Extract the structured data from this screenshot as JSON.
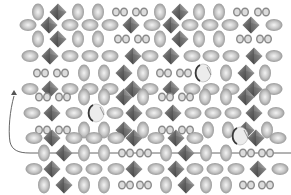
{
  "figure": {
    "width": 291,
    "height": 195,
    "background": "#ffffff"
  },
  "colors": {
    "ellipsoid_edge": "#9a9a9a",
    "ellipsoid_center": "#f2f2f2",
    "ellipsoid_mid": "#c4c4c4",
    "octahedron_dark": "#4a4a4a",
    "octahedron_mid": "#7a7a7a",
    "octahedron_light": "#a8a8a8",
    "ring": "#8a8a8a",
    "path": "#555555"
  },
  "period_x": 140,
  "rows": [
    {
      "y": 12,
      "items": [
        {
          "t": "v",
          "x": 38
        },
        {
          "t": "o",
          "x": 58
        },
        {
          "t": "v",
          "x": 78
        },
        {
          "t": "v",
          "x": 98
        },
        {
          "t": "r",
          "x": 116
        },
        {
          "t": "r",
          "x": 124
        },
        {
          "t": "r",
          "x": 136
        },
        {
          "t": "r",
          "x": 144
        },
        {
          "t": "v",
          "x": 160
        },
        {
          "t": "o",
          "x": 180
        },
        {
          "t": "v",
          "x": 199
        },
        {
          "t": "v",
          "x": 219
        },
        {
          "t": "r",
          "x": 237
        },
        {
          "t": "r",
          "x": 245
        },
        {
          "t": "r",
          "x": 258
        },
        {
          "t": "r",
          "x": 266
        }
      ]
    },
    {
      "y": 25,
      "items": [
        {
          "t": "h",
          "x": 28
        },
        {
          "t": "o",
          "x": 49
        },
        {
          "t": "h",
          "x": 70
        },
        {
          "t": "h",
          "x": 90
        },
        {
          "t": "h",
          "x": 110
        },
        {
          "t": "o",
          "x": 131
        },
        {
          "t": "h",
          "x": 152
        },
        {
          "t": "o",
          "x": 171
        },
        {
          "t": "h",
          "x": 190
        },
        {
          "t": "h",
          "x": 210
        },
        {
          "t": "h",
          "x": 230
        },
        {
          "t": "o",
          "x": 251
        },
        {
          "t": "h",
          "x": 274
        }
      ]
    },
    {
      "y": 39,
      "items": [
        {
          "t": "v",
          "x": 38
        },
        {
          "t": "o",
          "x": 58
        },
        {
          "t": "v",
          "x": 78
        },
        {
          "t": "v",
          "x": 98
        },
        {
          "t": "r",
          "x": 118
        },
        {
          "t": "r",
          "x": 126
        },
        {
          "t": "r",
          "x": 138
        },
        {
          "t": "r",
          "x": 146
        },
        {
          "t": "v",
          "x": 160
        },
        {
          "t": "o",
          "x": 180
        },
        {
          "t": "v",
          "x": 199
        },
        {
          "t": "v",
          "x": 219
        },
        {
          "t": "r",
          "x": 240
        },
        {
          "t": "r",
          "x": 248
        },
        {
          "t": "r",
          "x": 260
        },
        {
          "t": "r",
          "x": 268
        }
      ]
    },
    {
      "y": 56,
      "items": [
        {
          "t": "h",
          "x": 30
        },
        {
          "t": "o",
          "x": 50
        },
        {
          "t": "h",
          "x": 70
        },
        {
          "t": "h",
          "x": 90
        },
        {
          "t": "h",
          "x": 110
        },
        {
          "t": "o",
          "x": 133
        },
        {
          "t": "h",
          "x": 150
        },
        {
          "t": "o",
          "x": 171
        },
        {
          "t": "h",
          "x": 192
        },
        {
          "t": "h",
          "x": 211
        },
        {
          "t": "h",
          "x": 231
        },
        {
          "t": "o",
          "x": 254
        },
        {
          "t": "h",
          "x": 274
        }
      ]
    },
    {
      "y": 73,
      "items": [
        {
          "t": "r",
          "x": 37
        },
        {
          "t": "r",
          "x": 45
        },
        {
          "t": "r",
          "x": 57
        },
        {
          "t": "r",
          "x": 65
        },
        {
          "t": "v",
          "x": 84
        },
        {
          "t": "v",
          "x": 104
        },
        {
          "t": "o",
          "x": 124
        },
        {
          "t": "v",
          "x": 143
        },
        {
          "t": "r",
          "x": 160
        },
        {
          "t": "r",
          "x": 168
        },
        {
          "t": "r",
          "x": 180
        },
        {
          "t": "r",
          "x": 188
        },
        {
          "t": "v",
          "x": 205
        },
        {
          "t": "v",
          "x": 226
        },
        {
          "t": "o",
          "x": 246
        },
        {
          "t": "v",
          "x": 265
        }
      ]
    },
    {
      "y": 80,
      "items": [
        {
          "t": "c",
          "x": 203,
          "y": 73
        }
      ]
    },
    {
      "y": 89,
      "items": [
        {
          "t": "h",
          "x": 30
        },
        {
          "t": "o",
          "x": 50
        },
        {
          "t": "h",
          "x": 70
        },
        {
          "t": "h",
          "x": 90
        },
        {
          "t": "h",
          "x": 110
        },
        {
          "t": "o",
          "x": 133
        },
        {
          "t": "h",
          "x": 150
        },
        {
          "t": "o",
          "x": 171
        },
        {
          "t": "h",
          "x": 192
        },
        {
          "t": "h",
          "x": 211
        },
        {
          "t": "h",
          "x": 231
        },
        {
          "t": "o",
          "x": 254
        },
        {
          "t": "h",
          "x": 274
        }
      ]
    },
    {
      "y": 97,
      "items": [
        {
          "t": "r",
          "x": 39
        },
        {
          "t": "r",
          "x": 47
        },
        {
          "t": "r",
          "x": 59
        },
        {
          "t": "r",
          "x": 67
        },
        {
          "t": "v",
          "x": 84
        },
        {
          "t": "v",
          "x": 104
        },
        {
          "t": "o",
          "x": 124
        },
        {
          "t": "v",
          "x": 143
        },
        {
          "t": "r",
          "x": 162
        },
        {
          "t": "r",
          "x": 170
        },
        {
          "t": "r",
          "x": 182
        },
        {
          "t": "r",
          "x": 190
        },
        {
          "t": "v",
          "x": 205
        },
        {
          "t": "v",
          "x": 226
        },
        {
          "t": "o",
          "x": 246
        },
        {
          "t": "v",
          "x": 265
        }
      ]
    },
    {
      "y": 113,
      "items": [
        {
          "t": "h",
          "x": 32
        },
        {
          "t": "o",
          "x": 52
        },
        {
          "t": "h",
          "x": 74
        },
        {
          "t": "c",
          "x": 96
        },
        {
          "t": "h",
          "x": 115
        },
        {
          "t": "o",
          "x": 134
        },
        {
          "t": "h",
          "x": 154
        },
        {
          "t": "o",
          "x": 173
        },
        {
          "t": "h",
          "x": 193
        },
        {
          "t": "h",
          "x": 213
        },
        {
          "t": "h",
          "x": 233
        },
        {
          "t": "o",
          "x": 254
        },
        {
          "t": "h",
          "x": 276
        }
      ]
    },
    {
      "y": 130,
      "items": [
        {
          "t": "r",
          "x": 39
        },
        {
          "t": "r",
          "x": 47
        },
        {
          "t": "r",
          "x": 59
        },
        {
          "t": "r",
          "x": 67
        },
        {
          "t": "v",
          "x": 84
        },
        {
          "t": "v",
          "x": 104
        },
        {
          "t": "o",
          "x": 124
        },
        {
          "t": "v",
          "x": 143
        },
        {
          "t": "r",
          "x": 162
        },
        {
          "t": "r",
          "x": 170
        },
        {
          "t": "r",
          "x": 182
        },
        {
          "t": "r",
          "x": 190
        },
        {
          "t": "v",
          "x": 208
        },
        {
          "t": "v",
          "x": 228
        },
        {
          "t": "o",
          "x": 246
        },
        {
          "t": "v",
          "x": 267
        }
      ]
    },
    {
      "y": 138,
      "items": [
        {
          "t": "h",
          "x": 34
        },
        {
          "t": "o",
          "x": 52
        },
        {
          "t": "h",
          "x": 74
        },
        {
          "t": "h",
          "x": 94
        },
        {
          "t": "h",
          "x": 116
        },
        {
          "t": "o",
          "x": 134
        },
        {
          "t": "h",
          "x": 156
        },
        {
          "t": "o",
          "x": 176
        },
        {
          "t": "h",
          "x": 195
        },
        {
          "t": "c",
          "x": 240,
          "y": 136
        },
        {
          "t": "o",
          "x": 256
        },
        {
          "t": "h",
          "x": 278
        }
      ]
    },
    {
      "y": 153,
      "items": [
        {
          "t": "v",
          "x": 44
        },
        {
          "t": "o",
          "x": 64
        },
        {
          "t": "v",
          "x": 84
        },
        {
          "t": "v",
          "x": 104
        },
        {
          "t": "r",
          "x": 122
        },
        {
          "t": "r",
          "x": 130
        },
        {
          "t": "r",
          "x": 140
        },
        {
          "t": "r",
          "x": 148
        },
        {
          "t": "v",
          "x": 166
        },
        {
          "t": "o",
          "x": 186
        },
        {
          "t": "v",
          "x": 206
        },
        {
          "t": "v",
          "x": 226
        },
        {
          "t": "r",
          "x": 243
        },
        {
          "t": "r",
          "x": 251
        },
        {
          "t": "r",
          "x": 262
        },
        {
          "t": "r",
          "x": 270
        }
      ]
    },
    {
      "y": 169,
      "items": [
        {
          "t": "h",
          "x": 34
        },
        {
          "t": "o",
          "x": 52
        },
        {
          "t": "h",
          "x": 74
        },
        {
          "t": "h",
          "x": 94
        },
        {
          "t": "h",
          "x": 116
        },
        {
          "t": "o",
          "x": 134
        },
        {
          "t": "h",
          "x": 156
        },
        {
          "t": "o",
          "x": 176
        },
        {
          "t": "h",
          "x": 195
        },
        {
          "t": "h",
          "x": 215
        },
        {
          "t": "h",
          "x": 236
        },
        {
          "t": "o",
          "x": 258
        },
        {
          "t": "h",
          "x": 280
        }
      ]
    },
    {
      "y": 185,
      "items": [
        {
          "t": "v",
          "x": 44
        },
        {
          "t": "o",
          "x": 64
        },
        {
          "t": "v",
          "x": 84
        },
        {
          "t": "v",
          "x": 104
        },
        {
          "t": "r",
          "x": 122
        },
        {
          "t": "r",
          "x": 130
        },
        {
          "t": "r",
          "x": 140
        },
        {
          "t": "r",
          "x": 148
        },
        {
          "t": "v",
          "x": 166
        },
        {
          "t": "o",
          "x": 186
        },
        {
          "t": "v",
          "x": 206
        },
        {
          "t": "v",
          "x": 226
        },
        {
          "t": "r",
          "x": 243
        },
        {
          "t": "r",
          "x": 251
        },
        {
          "t": "r",
          "x": 262
        },
        {
          "t": "r",
          "x": 270
        }
      ]
    }
  ],
  "path": {
    "d": "M 14 96 C 10 110, 8 130, 10 142 C 12 150, 18 153, 30 153 L 291 153",
    "arrow_tip": {
      "x": 14,
      "y": 90
    }
  }
}
